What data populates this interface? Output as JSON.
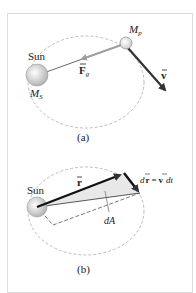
{
  "figure": {
    "panel_a": {
      "sun_label": "Sun",
      "sun_mass_label": "M",
      "sun_mass_sub": "S",
      "planet_mass_label": "M",
      "planet_mass_sub": "p",
      "force_label": "F",
      "force_sub": "g",
      "velocity_label": "v",
      "caption": "(a)"
    },
    "panel_b": {
      "sun_label": "Sun",
      "radius_label": "r",
      "displacement_label_d": "d",
      "displacement_label_r": "r",
      "equals": "=",
      "displacement_label_v": "v",
      "displacement_label_dt": "dt",
      "area_label": "dA",
      "caption": "(b)"
    },
    "colors": {
      "orbit": "#b8b8b8",
      "vector": "#333333",
      "force": "#a0a0a0",
      "area_fill": "#e6e6e6",
      "sun_fill": "#d0d0d0"
    }
  }
}
